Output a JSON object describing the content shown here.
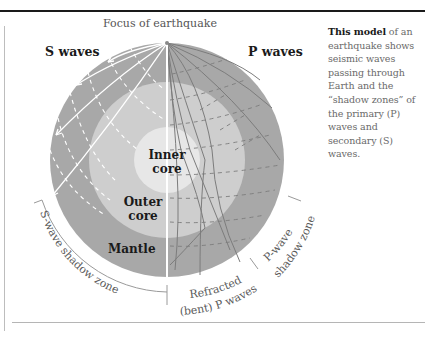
{
  "diagram": {
    "title": "Focus of earthquake",
    "wave_labels": {
      "s_waves": "S waves",
      "p_waves": "P waves"
    },
    "layers": {
      "inner_core": {
        "line1": "Inner",
        "line2": "core",
        "color": "#e6e6e6"
      },
      "outer_core": {
        "line1": "Outer",
        "line2": "core",
        "color": "#cfcfcf"
      },
      "mantle": {
        "label": "Mantle",
        "color": "#a9a9a9"
      }
    },
    "zones": {
      "s_wave_shadow_zone": "S-wave shadow zone",
      "refracted_p_waves_line1": "Refracted",
      "refracted_p_waves_line2": "(bent) P waves",
      "p_wave_shadow_zone_line1": "P-wave",
      "p_wave_shadow_zone_line2": "shadow zone"
    },
    "colors": {
      "s_wave_lines": "#ffffff",
      "p_wave_lines": "#7a7a7a",
      "divider": "#ffffff",
      "zone_arc": "#9a9a9a"
    }
  },
  "caption": {
    "bold_lead": "This model",
    "body": " of an earthquake shows seismic waves passing through Earth and the “shadow zones” of the primary (P) waves and secondary (S) waves."
  }
}
